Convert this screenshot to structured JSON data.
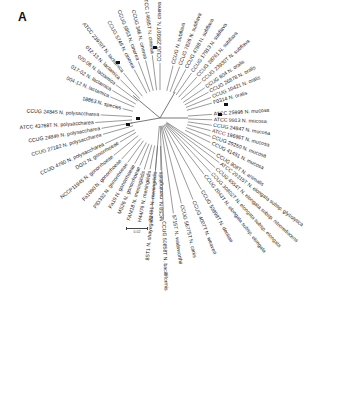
{
  "figure": {
    "panel_label": "A",
    "scale_bar_label": "0.02",
    "center": [
      160,
      118
    ],
    "colors": {
      "branch": "#555555",
      "text": "#222222",
      "node_marker": "#111111",
      "grey_marker": "#9a9a9a"
    }
  },
  "leaves": [
    {
      "label": "CCUG 24846 N. polysaccharea",
      "angle": 190,
      "len": 108
    },
    {
      "label": "ATCC 43768T N. polysaccharea",
      "angle": 184,
      "len": 118
    },
    {
      "label": "CCUG 24845 N. polysaccharea",
      "angle": 177,
      "len": 108
    },
    {
      "label": "CCUG 27182 N. polysaccharea",
      "angle": 196,
      "len": 108
    },
    {
      "label": "CCUG 4790 N. polysaccharea",
      "angle": 205,
      "len": 110
    },
    {
      "label": "DGI2 N. gonorrhoeae",
      "angle": 211,
      "len": 85
    },
    {
      "label": "NCCP11945 N. gonorrhoeae",
      "angle": 219,
      "len": 108
    },
    {
      "label": "Fa1090 N. gonorrhoeae",
      "angle": 227,
      "len": 102
    },
    {
      "label": "PID332 N. gonorrhoeae",
      "angle": 234,
      "len": 100
    },
    {
      "label": "Fa19 N. gonorrhoeae",
      "angle": 241,
      "len": 95
    },
    {
      "label": "MS26 N. gonorrhoeae",
      "angle": 247,
      "len": 94
    },
    {
      "label": "FAM18 N. meningitidis",
      "angle": 253,
      "len": 98
    },
    {
      "label": "H44/76 N. meningitidis",
      "angle": 259,
      "len": 95
    },
    {
      "label": "Z2491 N. meningitidis",
      "angle": 265,
      "len": 95
    },
    {
      "label": "MC58 N. meningitidis",
      "angle": 271,
      "len": 95
    },
    {
      "label": "18863 N. species",
      "angle": 166,
      "len": 70
    },
    {
      "label": "004-12 N. lactamica",
      "angle": 157,
      "len": 98
    },
    {
      "label": "017-02 N. lactamica",
      "angle": 150,
      "len": 100
    },
    {
      "label": "020-06 N. lactamica",
      "angle": 143,
      "len": 100
    },
    {
      "label": "012-13 N. lactamica",
      "angle": 136,
      "len": 100
    },
    {
      "label": "ATCC 23970T N. lactamica",
      "angle": 129,
      "len": 105
    },
    {
      "label": "CCUG 5746 N. cinerea",
      "angle": 118,
      "len": 100
    },
    {
      "label": "CCUG 5853 N. cinerea",
      "angle": 111,
      "len": 110
    },
    {
      "label": "CCUG 346 N. cinerea",
      "angle": 104,
      "len": 108
    },
    {
      "label": "ATCC 14685T N. cinerea",
      "angle": 97,
      "len": 115
    },
    {
      "label": "CCUG 23930T N. cinerea",
      "angle": 90,
      "len": 100
    },
    {
      "label": "CCUG N. subflava",
      "angle": 76,
      "len": 98
    },
    {
      "label": "CCUG 7826 N. subflava",
      "angle": 69,
      "len": 100
    },
    {
      "label": "CCUG 4788 N. subflava",
      "angle": 62,
      "len": 100
    },
    {
      "label": "CCUG 17913 N. subflava",
      "angle": 55,
      "len": 100
    },
    {
      "label": "CCUG 28761 N. subflava",
      "angle": 48,
      "len": 100
    },
    {
      "label": "CCUG 23930T N. subflava",
      "angle": 41,
      "len": 100
    },
    {
      "label": "CCUG 804 N. oralis",
      "angle": 34,
      "len": 98
    },
    {
      "label": "CCUG 26878 N. oralis",
      "angle": 28,
      "len": 100
    },
    {
      "label": "CCUG 10421 N. oralis",
      "angle": 22,
      "len": 100
    },
    {
      "label": "F0314 N. oralis",
      "angle": 16,
      "len": 98
    },
    {
      "label": "ATCC 25996 N. mucosa",
      "angle": 4,
      "len": 95
    },
    {
      "label": "ATCC 9913 N. mucosa",
      "angle": -2,
      "len": 95
    },
    {
      "label": "CCUG 24847 N. mucosa",
      "angle": -8,
      "len": 95
    },
    {
      "label": "ATCC 19696T N. mucosa",
      "angle": -14,
      "len": 95
    },
    {
      "label": "CCUG 29250 N. mucosa",
      "angle": -20,
      "len": 98
    },
    {
      "label": "CCUG 41451 N. mucosa",
      "angle": -26,
      "len": 102
    },
    {
      "label": "CCUG 808T N. animalis",
      "angle": -33,
      "len": 120
    },
    {
      "label": "ATCC 29315T N. elongata subsp. glycolytica",
      "angle": -37,
      "len": 135
    },
    {
      "label": "CCUG 4554T N. elongata subsp. nitroreducens",
      "angle": -42,
      "len": 135
    },
    {
      "label": "CCUG 30802T N. elongata subsp. elongata",
      "angle": -47,
      "len": 135
    },
    {
      "label": "CCUG 2043T N. elongata subsp. elongata",
      "angle": -52,
      "len": 130
    },
    {
      "label": "CCUG 53898T N. dentiae",
      "angle": -60,
      "len": 150
    },
    {
      "label": "CCUG 4007T N. weaveri",
      "angle": -68,
      "len": 160
    },
    {
      "label": "CCUG 56775T N. canis",
      "angle": -76,
      "len": 160
    },
    {
      "label": "9715T N. wadsworthii",
      "angle": -82,
      "len": 175
    },
    {
      "label": "CCUG 50858T N. bacilliformis",
      "angle": -88,
      "len": 185
    },
    {
      "label": "8ST1 N. shayeganii",
      "angle": -95,
      "len": 175
    }
  ]
}
